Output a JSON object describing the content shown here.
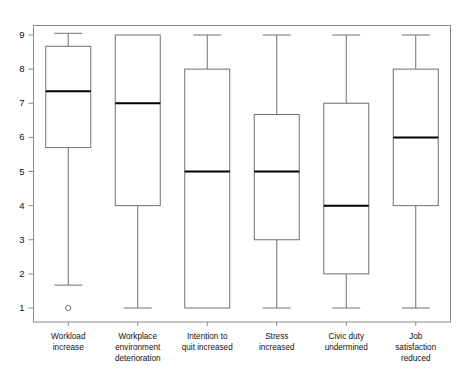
{
  "chart_data": {
    "type": "box",
    "title": "",
    "xlabel": "",
    "ylabel": "",
    "ylim": [
      0.55,
      9.45
    ],
    "y_ticks": [
      1,
      2,
      3,
      4,
      5,
      6,
      7,
      8,
      9
    ],
    "y_tick_labels": [
      "1",
      "2",
      "3",
      "4",
      "5",
      "6",
      "7",
      "8",
      "9"
    ],
    "grid": false,
    "legend": "none",
    "categories": [
      "Workload increase",
      "Workplace environment deterioration",
      "Intention to quit increased",
      "Stress increased",
      "Civic duty undermined",
      "Job satisfaction reduced"
    ],
    "category_label_lines": [
      [
        "Workload",
        "increase"
      ],
      [
        "Workplace",
        "environment",
        "deterioration"
      ],
      [
        "Intention to",
        "quit increased"
      ],
      [
        "Stress",
        "increased"
      ],
      [
        "Civic duty",
        "undermined"
      ],
      [
        "Job",
        "satisfaction",
        "reduced"
      ]
    ],
    "boxes": [
      {
        "name": "Workload increase",
        "whisker_low": 1.67,
        "q1": 5.7,
        "median": 7.35,
        "q3": 8.67,
        "whisker_high": 9.05,
        "outliers": [
          1.0
        ]
      },
      {
        "name": "Workplace environment deterioration",
        "whisker_low": 1.0,
        "q1": 4.0,
        "median": 7.0,
        "q3": 9.0,
        "whisker_high": 9.0,
        "outliers": []
      },
      {
        "name": "Intention to quit increased",
        "whisker_low": 1.0,
        "q1": 1.0,
        "median": 5.0,
        "q3": 8.0,
        "whisker_high": 9.0,
        "outliers": []
      },
      {
        "name": "Stress increased",
        "whisker_low": 1.0,
        "q1": 3.0,
        "median": 5.0,
        "q3": 6.67,
        "whisker_high": 9.0,
        "outliers": []
      },
      {
        "name": "Civic duty undermined",
        "whisker_low": 1.0,
        "q1": 2.0,
        "median": 4.0,
        "q3": 7.0,
        "whisker_high": 9.0,
        "outliers": []
      },
      {
        "name": "Job satisfaction reduced",
        "whisker_low": 1.0,
        "q1": 4.0,
        "median": 6.0,
        "q3": 8.0,
        "whisker_high": 9.0,
        "outliers": []
      }
    ],
    "colors": {
      "frame": "#8a8a8a",
      "box_stroke": "#6f6f6f",
      "box_fill": "#ffffff",
      "median": "#000000",
      "text": "#111111",
      "background": "#ffffff"
    }
  }
}
